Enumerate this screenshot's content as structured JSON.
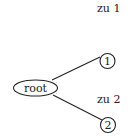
{
  "diagram": {
    "type": "tree",
    "root": {
      "label": "root"
    },
    "children": [
      {
        "label": "1",
        "edge_label": "zu 1"
      },
      {
        "label": "2",
        "edge_label": "zu 2"
      }
    ],
    "colors": {
      "stroke": "#222222",
      "background": "#ffffff"
    }
  }
}
